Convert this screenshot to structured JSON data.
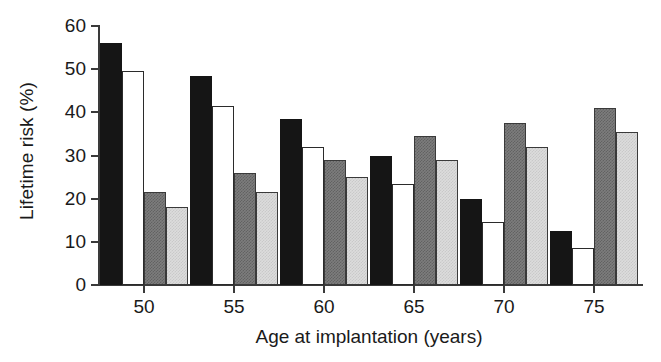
{
  "chart_data": {
    "type": "bar",
    "title": "",
    "xlabel": "Age at implantation (years)",
    "ylabel": "Lifetime risk (%)",
    "categories": [
      "50",
      "55",
      "60",
      "65",
      "70",
      "75"
    ],
    "ylim": [
      0,
      60
    ],
    "yticks": [
      0,
      10,
      20,
      30,
      40,
      50,
      60
    ],
    "ytick_labels": [
      "0",
      "10",
      "20",
      "30",
      "40",
      "50",
      "60"
    ],
    "grid": false,
    "legend": "none",
    "series": [
      {
        "name": "series-1",
        "fill": "black",
        "color": "#151515",
        "values": [
          56.0,
          48.5,
          38.5,
          30.0,
          20.0,
          12.5
        ]
      },
      {
        "name": "series-2",
        "fill": "white",
        "color": "#ffffff",
        "values": [
          49.5,
          41.5,
          32.0,
          23.5,
          14.5,
          8.5
        ]
      },
      {
        "name": "series-3",
        "fill": "dark-gray",
        "color": "#7d7d7d",
        "values": [
          21.5,
          26.0,
          29.0,
          34.5,
          37.5,
          41.0
        ]
      },
      {
        "name": "series-4",
        "fill": "light-gray",
        "color": "#dcdcdc",
        "values": [
          18.0,
          21.5,
          25.0,
          29.0,
          32.0,
          35.5
        ]
      }
    ]
  }
}
